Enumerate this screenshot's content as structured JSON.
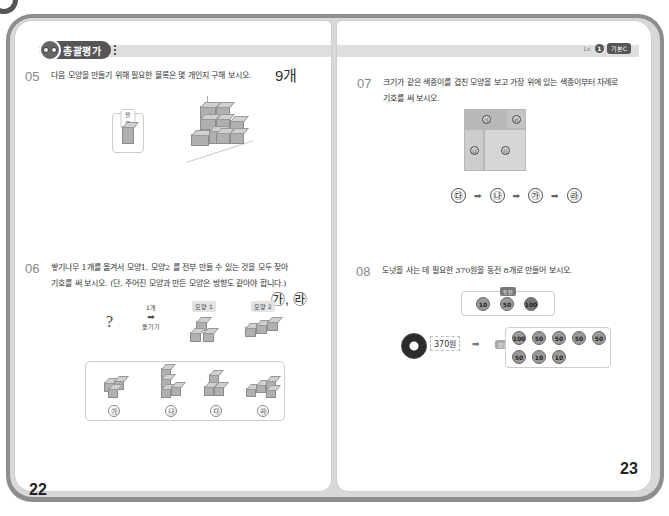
{
  "corner_fragment_text": "정나",
  "header": {
    "section_label": "총괄평가",
    "level_prefix": "Lv.",
    "level_number": "1",
    "level_tag": "기본C"
  },
  "pages": {
    "left_number": "22",
    "right_number": "23"
  },
  "questions": {
    "q05": {
      "number": "05",
      "text": "다음 모양을 만들기 위해 필요한 블록은 몇 개인지 구해 보시오.",
      "answer": "9개",
      "block_label": "블록"
    },
    "q06": {
      "number": "06",
      "line1": "쌓기나무 1개를 옮겨서 모양1, 모양2 를 전부 만들 수 있는 것을 모두 찾아",
      "line2": "기호를 써 보시오. (단, 주어진 모양과 만든 모양은 방향도 같아야 합니다.)",
      "answer": "㉮, ㉱",
      "question_mark": "?",
      "arrow_top": "1개",
      "arrow_bottom": "옮기기",
      "shape1_label": "모양 1",
      "shape2_label": "모양 2",
      "choices": [
        "㉮",
        "㉯",
        "㉰",
        "㉱"
      ]
    },
    "q07": {
      "number": "07",
      "line1": "크기가 같은 색종이를 겹친 모양을 보고 가장 위에 있는 색종이부터 차례로",
      "line2": "기호를 써 보시오.",
      "paper_marks": [
        "㉮",
        "㉱",
        "㉯",
        "㉰"
      ],
      "sequence": [
        "㉰",
        "㉯",
        "㉮",
        "㉱"
      ],
      "arrow": "➡"
    },
    "q08": {
      "number": "08",
      "text": "도넛을 사는 데 필요한 370원을 동전 8개로 만들어 보시오.",
      "coin_box_label": "동전",
      "coin_types": [
        "10",
        "50",
        "100"
      ],
      "price": "370원",
      "arrow": "➡",
      "answer_label": "정답",
      "answer_coins": [
        "100",
        "50",
        "50",
        "50",
        "50",
        "50",
        "10",
        "10"
      ]
    }
  }
}
